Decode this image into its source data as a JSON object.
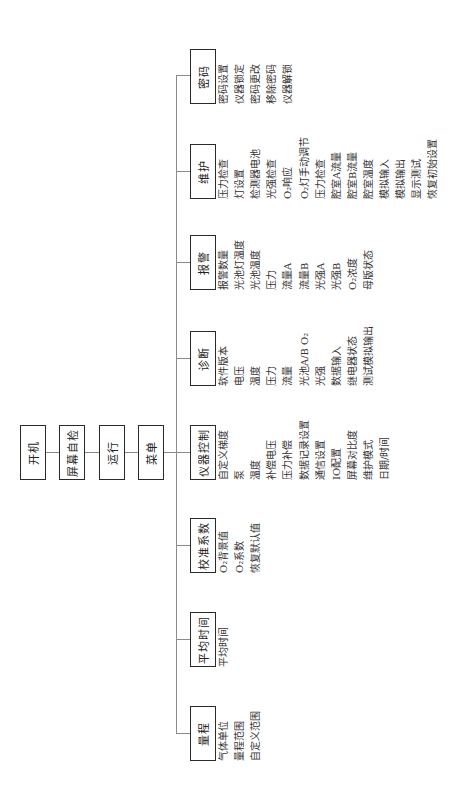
{
  "chain": [
    {
      "label": "开机"
    },
    {
      "label": "屏幕自检"
    },
    {
      "label": "运行"
    },
    {
      "label": "菜单"
    }
  ],
  "categories": [
    {
      "label": "量程",
      "items": [
        "气体单位",
        "量程范围",
        "自定义范围"
      ]
    },
    {
      "label": "平均时间",
      "items": [
        "平均时间"
      ]
    },
    {
      "label": "校准系数",
      "items": [
        "O₂背景值",
        "O₂系数",
        "恢复默认值"
      ]
    },
    {
      "label": "仪器控制",
      "items": [
        "自定义梯度",
        "泵",
        "温度",
        "补偿电压",
        "压力补偿",
        "数据记录设置",
        "通信设置",
        "IO配置",
        "屏幕对比度",
        "维护模式",
        "日期/时间"
      ]
    },
    {
      "label": "诊断",
      "items": [
        "软件版本",
        "电压",
        "温度",
        "压力",
        "流量",
        "光池A/B O₂",
        "光强",
        "数据输入",
        "继电器状态",
        "测试模拟输出"
      ]
    },
    {
      "label": "报警",
      "items": [
        "报警数量",
        "光池灯温度",
        "光池温度",
        "压力",
        "流量A",
        "流量B",
        "光强A",
        "光强B",
        "O₂浓度",
        "母版状态"
      ]
    },
    {
      "label": "维护",
      "items": [
        "压力检查",
        "灯设置",
        "检测器电池",
        "光强检查",
        "O₂响应",
        "O₂灯手动调节",
        "压力检查",
        "腔室A流量",
        "腔室B流量",
        "腔室温度",
        "模拟输入",
        "模拟输出",
        "显示测试",
        "恢复初始设置"
      ]
    },
    {
      "label": "密码",
      "items": [
        "密码设置",
        "仪器锁定",
        "密码更改",
        "移除密码",
        "仪器解锁"
      ]
    }
  ]
}
